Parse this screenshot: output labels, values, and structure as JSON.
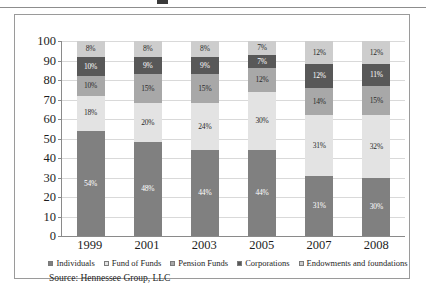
{
  "source_note": "Source: Hennessee Group, LLC",
  "chart_data": {
    "type": "bar",
    "subtype": "100% stacked column",
    "title": "",
    "xlabel": "",
    "ylabel": "",
    "ylim": [
      0,
      100
    ],
    "yticks": [
      0,
      10,
      20,
      30,
      40,
      50,
      60,
      70,
      80,
      90,
      100
    ],
    "ytick_labels": [
      "0",
      "10",
      "20",
      "30",
      "40",
      "50",
      "60",
      "70",
      "80",
      "90",
      "100"
    ],
    "grid": true,
    "legend_position": "bottom",
    "categories": [
      "1999",
      "2001",
      "2003",
      "2005",
      "2007",
      "2008"
    ],
    "series": [
      {
        "name": "Individuals",
        "color": "#808080",
        "label_color": "on-dark",
        "values": [
          54,
          48,
          44,
          44,
          31,
          30
        ],
        "labels": [
          "54%",
          "48%",
          "44%",
          "44%",
          "31%",
          "30%"
        ]
      },
      {
        "name": "Fund of Funds",
        "color": "#e3e3e3",
        "label_color": "on-light",
        "values": [
          18,
          20,
          24,
          30,
          31,
          32
        ],
        "labels": [
          "18%",
          "20%",
          "24%",
          "30%",
          "31%",
          "32%"
        ]
      },
      {
        "name": "Pension Funds",
        "color": "#a8a8a8",
        "label_color": "on-light",
        "values": [
          10,
          15,
          15,
          12,
          14,
          15
        ],
        "labels": [
          "10%",
          "15%",
          "15%",
          "12%",
          "14%",
          "15%"
        ]
      },
      {
        "name": "Corporations",
        "color": "#585858",
        "label_color": "on-dark",
        "values": [
          10,
          9,
          9,
          7,
          12,
          11
        ],
        "labels": [
          "10%",
          "9%",
          "9%",
          "7%",
          "12%",
          "11%"
        ]
      },
      {
        "name": "Endowments and foundations",
        "color": "#cdcdcd",
        "label_color": "on-light",
        "values": [
          8,
          8,
          8,
          7,
          12,
          12
        ],
        "labels": [
          "8%",
          "8%",
          "8%",
          "7%",
          "12%",
          "12%"
        ]
      }
    ]
  }
}
